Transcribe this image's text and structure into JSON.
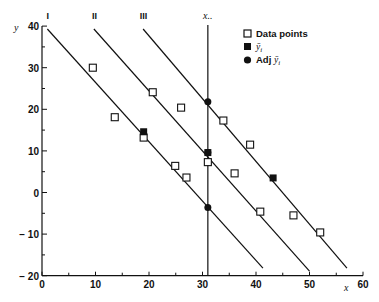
{
  "chart_data": {
    "type": "scatter",
    "title": "",
    "xlabel": "x",
    "ylabel": "y",
    "xlim": [
      0,
      60
    ],
    "ylim": [
      -20,
      40
    ],
    "x_ticks": [
      0,
      10,
      20,
      30,
      40,
      50,
      60
    ],
    "y_ticks": [
      -20,
      -10,
      0,
      10,
      20,
      30,
      40
    ],
    "x_tick_labels": [
      "0",
      "10",
      "20",
      "30",
      "40",
      "50",
      "60"
    ],
    "y_tick_labels": [
      "− 20",
      "− 10",
      "0",
      "10",
      "20",
      "30",
      "40"
    ],
    "grid": false,
    "legend_position": "upper right",
    "legend": [
      {
        "marker": "open-square",
        "label": "Data points"
      },
      {
        "marker": "filled-square",
        "label": "ȳᵢ"
      },
      {
        "marker": "filled-circle",
        "label": "Adj ȳᵢ"
      }
    ],
    "reference_line": {
      "label": "x..",
      "x": 31
    },
    "lines": [
      {
        "name": "I",
        "x1": 1,
        "y1": 39.3,
        "x2": 41.3,
        "y2": -18.2
      },
      {
        "name": "II",
        "x1": 9.7,
        "y1": 39.3,
        "x2": 50.0,
        "y2": -18.9
      },
      {
        "name": "III",
        "x1": 18.9,
        "y1": 39.3,
        "x2": 57.0,
        "y2": -18.2
      }
    ],
    "series": [
      {
        "name": "Data points",
        "marker": "open-square",
        "points": [
          [
            9.5,
            30.0
          ],
          [
            13.6,
            18.1
          ],
          [
            19.0,
            13.2
          ],
          [
            20.7,
            24.1
          ],
          [
            26.0,
            20.4
          ],
          [
            24.9,
            6.4
          ],
          [
            27.0,
            3.6
          ],
          [
            31.0,
            7.3
          ],
          [
            36.0,
            4.6
          ],
          [
            33.9,
            17.3
          ],
          [
            38.9,
            11.5
          ],
          [
            40.8,
            -4.6
          ],
          [
            47.0,
            -5.5
          ],
          [
            52.0,
            -9.6
          ]
        ]
      },
      {
        "name": "ȳᵢ",
        "marker": "filled-square",
        "points": [
          [
            19.0,
            14.6
          ],
          [
            31.0,
            9.6
          ],
          [
            43.2,
            3.5
          ]
        ]
      },
      {
        "name": "Adj ȳᵢ",
        "marker": "filled-circle",
        "points": [
          [
            31.0,
            21.8
          ],
          [
            31.0,
            9.6
          ],
          [
            31.0,
            -3.6
          ]
        ]
      }
    ]
  },
  "layout": {
    "plot": {
      "x0_px": 42,
      "x_scale": 5.35,
      "y0_px": 192.5,
      "y_scale": 4.16,
      "axis_color": "#111111"
    }
  },
  "labels": {
    "y_axis": "y",
    "x_axis": "x",
    "reference": "x..",
    "legend_data_points": "Data points",
    "legend_mean": "ȳ",
    "legend_mean_sub": "i",
    "legend_adj_prefix": "Adj ",
    "legend_adj": "ȳ",
    "legend_adj_sub": "i"
  }
}
